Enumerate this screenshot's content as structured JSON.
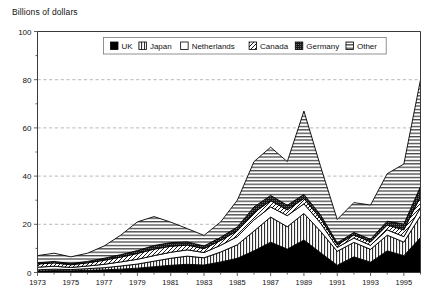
{
  "chart_data": {
    "type": "area",
    "title": "",
    "ylabel": "Billions of dollars",
    "xlabel": "",
    "ylim": [
      0,
      100
    ],
    "yticks": [
      0,
      20,
      40,
      60,
      80,
      100
    ],
    "xlim": [
      1973,
      1996
    ],
    "grid": true,
    "stacked": true,
    "legend_position": "top-inside",
    "x": [
      1973,
      1974,
      1975,
      1976,
      1977,
      1978,
      1979,
      1980,
      1981,
      1982,
      1983,
      1984,
      1985,
      1986,
      1987,
      1988,
      1989,
      1990,
      1991,
      1992,
      1993,
      1994,
      1995,
      1996
    ],
    "xtick_labels": [
      "1973",
      "1975",
      "1977",
      "1979",
      "1981",
      "1983",
      "1985",
      "1987",
      "1989",
      "1991",
      "1993",
      "1995"
    ],
    "xtick_values": [
      1973,
      1975,
      1977,
      1979,
      1981,
      1983,
      1985,
      1987,
      1989,
      1991,
      1993,
      1995
    ],
    "series": [
      {
        "name": "UK",
        "pattern": "solid-black",
        "values": [
          0.6,
          0.8,
          0.7,
          0.9,
          1.1,
          1.4,
          1.8,
          2.4,
          3.0,
          3.4,
          3.1,
          4.4,
          5.9,
          9.0,
          12.6,
          9.7,
          13.5,
          8.2,
          3.0,
          6.5,
          4.3,
          9.0,
          7.0,
          14.5
        ]
      },
      {
        "name": "Japan",
        "pattern": "vertical-lines",
        "values": [
          0.5,
          0.6,
          0.5,
          0.7,
          0.9,
          1.3,
          1.7,
          2.3,
          2.9,
          3.4,
          3.0,
          4.1,
          5.6,
          8.2,
          10.4,
          9.3,
          11.0,
          8.9,
          5.8,
          6.0,
          5.3,
          6.5,
          5.6,
          9.0
        ]
      },
      {
        "name": "Netherlands",
        "pattern": "white",
        "values": [
          1.1,
          1.2,
          0.9,
          1.1,
          1.4,
          1.7,
          2.0,
          2.3,
          2.5,
          2.6,
          2.2,
          2.8,
          3.4,
          4.6,
          4.2,
          4.6,
          4.0,
          3.4,
          1.6,
          1.8,
          1.7,
          2.2,
          2.3,
          3.4
        ]
      },
      {
        "name": "Canada",
        "pattern": "diagonal-hatch",
        "values": [
          1.3,
          1.4,
          1.1,
          1.3,
          1.7,
          2.0,
          2.4,
          2.7,
          2.5,
          2.0,
          1.6,
          2.0,
          2.4,
          3.0,
          2.6,
          2.4,
          2.2,
          1.9,
          1.1,
          1.3,
          1.4,
          2.0,
          2.8,
          4.6
        ]
      },
      {
        "name": "Germany",
        "pattern": "dark-stipple",
        "values": [
          0.5,
          0.6,
          0.5,
          0.6,
          0.8,
          1.0,
          1.2,
          1.5,
          1.5,
          1.3,
          1.1,
          1.3,
          1.6,
          2.4,
          2.2,
          1.9,
          1.7,
          1.5,
          0.8,
          1.0,
          1.1,
          1.6,
          2.4,
          4.2
        ]
      },
      {
        "name": "Other",
        "pattern": "horizontal-lines",
        "values": [
          3.0,
          3.4,
          2.8,
          3.4,
          5.1,
          8.1,
          11.9,
          12.0,
          8.5,
          5.5,
          4.4,
          6.4,
          11.1,
          18.8,
          20.0,
          18.1,
          34.6,
          20.1,
          9.7,
          12.4,
          14.2,
          19.7,
          24.9,
          44.3
        ]
      }
    ],
    "totals": [
      7.0,
      8.0,
      6.5,
      8.0,
      11.0,
      15.5,
      21.0,
      23.2,
      20.9,
      18.2,
      15.4,
      21.0,
      30.0,
      46.0,
      52.0,
      46.0,
      67.0,
      44.0,
      22.0,
      29.0,
      28.0,
      41.0,
      45.0,
      80.0
    ]
  },
  "legend": {
    "items": [
      {
        "label": "UK",
        "pattern": "solid-black"
      },
      {
        "label": "Japan",
        "pattern": "vertical-lines"
      },
      {
        "label": "Netherlands",
        "pattern": "white"
      },
      {
        "label": "Canada",
        "pattern": "diagonal-hatch"
      },
      {
        "label": "Germany",
        "pattern": "dark-stipple"
      },
      {
        "label": "Other",
        "pattern": "horizontal-lines"
      }
    ]
  },
  "colors": {
    "axis": "#3a3a3a",
    "grid": "#9a9a9a",
    "ink": "#000000",
    "background": "#ffffff"
  }
}
